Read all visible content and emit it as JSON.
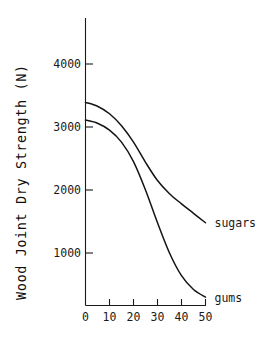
{
  "chart_data": {
    "type": "line",
    "title": "",
    "xlabel": "",
    "ylabel": "Wood Joint Dry Strength (N)",
    "xlim": [
      0,
      52
    ],
    "ylim": [
      0,
      4600
    ],
    "grid": false,
    "legend_position": "inline-right-of-curve-ends",
    "x_ticks": [
      0,
      10,
      20,
      30,
      40,
      50
    ],
    "x_tick_labels": [
      "0",
      "10",
      "20",
      "30",
      "40",
      "50"
    ],
    "y_ticks": [
      1000,
      2000,
      3000,
      4000
    ],
    "y_tick_labels": [
      "1000",
      "2000",
      "3000",
      "4000"
    ],
    "x": [
      0,
      5,
      10,
      15,
      20,
      25,
      30,
      35,
      40,
      45,
      50
    ],
    "series": [
      {
        "name": "sugars",
        "label": "sugars",
        "color": "#141414",
        "values": [
          3390,
          3330,
          3210,
          3020,
          2760,
          2440,
          2150,
          1940,
          1780,
          1630,
          1480
        ]
      },
      {
        "name": "gums",
        "label": "gums",
        "color": "#141414",
        "values": [
          3110,
          3060,
          2950,
          2760,
          2450,
          2000,
          1480,
          1000,
          640,
          420,
          300
        ]
      }
    ],
    "annotations": [
      {
        "text": "sugars",
        "x": 52,
        "y": 1480
      },
      {
        "text": "gums",
        "x": 52,
        "y": 300
      }
    ]
  },
  "axes": {
    "y_axis_title": "Wood Joint Dry Strength (N)"
  }
}
